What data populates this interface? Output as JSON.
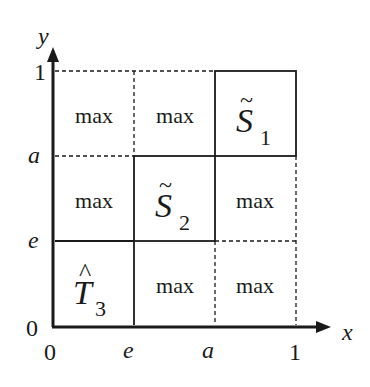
{
  "axes": {
    "x_label": "x",
    "y_label": "y",
    "x_ticks": [
      "0",
      "e",
      "a",
      "1"
    ],
    "y_ticks": [
      "0",
      "e",
      "a",
      "1"
    ]
  },
  "cells": {
    "r0c0": "max",
    "r0c1": "max",
    "r1c0": "max",
    "r1c2": "max",
    "r2c1": "max",
    "r2c2": "max"
  },
  "regions": {
    "s1": {
      "base": "S",
      "accent": "~",
      "sub": "1"
    },
    "s2": {
      "base": "S",
      "accent": "~",
      "sub": "2"
    },
    "t3": {
      "base": "T",
      "accent": "^",
      "sub": "3"
    }
  },
  "colors": {
    "ink": "#1a1a1a",
    "background": "#ffffff"
  }
}
